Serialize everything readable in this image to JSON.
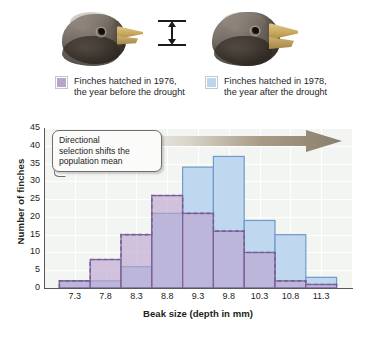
{
  "figure": {
    "legend": [
      {
        "id": "1976",
        "swatch_color": "#b9a3cd",
        "line1": "Finches hatched in 1976,",
        "line2": "the year before the drought",
        "bird_label": "finch-head-1976"
      },
      {
        "id": "1978",
        "swatch_color": "#bcd6ef",
        "line1": "Finches hatched in 1978,",
        "line2": "the year after the drought",
        "bird_label": "finch-head-1978"
      }
    ],
    "callout": {
      "line1": "Directional",
      "line2": "selection shifts the",
      "line3": "population mean",
      "text": "Directional selection shifts the population mean"
    },
    "arrow": {
      "name": "directional-shift-arrow",
      "direction": "right",
      "color_start": "#efefec",
      "color_end": "#8a7f6d"
    }
  },
  "chart_data": {
    "type": "bar",
    "title": "",
    "xlabel": "Beak size (depth in mm)",
    "ylabel": "Number of finches",
    "xlim": [
      7.05,
      11.55
    ],
    "ylim": [
      0,
      45
    ],
    "grid": true,
    "bin_width": 0.5,
    "legend_position": "above-plot",
    "x_tick_labels": [
      "7.3",
      "7.8",
      "8.3",
      "8.8",
      "9.3",
      "9.8",
      "10.3",
      "10.8",
      "11.3"
    ],
    "x_tick_values": [
      7.3,
      7.8,
      8.3,
      8.8,
      9.3,
      9.8,
      10.3,
      10.8,
      11.3
    ],
    "y_tick_labels": [
      "0",
      "5",
      "10",
      "15",
      "20",
      "25",
      "30",
      "35",
      "40",
      "45"
    ],
    "y_tick_values": [
      0,
      5,
      10,
      15,
      20,
      25,
      30,
      35,
      40,
      45
    ],
    "categories": [
      "7.3",
      "7.8",
      "8.3",
      "8.8",
      "9.3",
      "9.8",
      "10.3",
      "10.8",
      "11.3"
    ],
    "series": [
      {
        "name": "Finches hatched in 1976, the year before the drought",
        "short_name": "1976",
        "color": "#b9a3cd",
        "edge_color": "#7b5f96",
        "style": "dashed-outline-overlay",
        "values": [
          2,
          8,
          15,
          26,
          21,
          16,
          10,
          2,
          1
        ]
      },
      {
        "name": "Finches hatched in 1978, the year after the drought",
        "short_name": "1978",
        "color": "#bcd6ef",
        "edge_color": "#6f9bc8",
        "style": "solid-outline",
        "values": [
          2,
          2,
          6,
          21,
          34,
          37,
          19,
          15,
          3
        ]
      }
    ]
  }
}
